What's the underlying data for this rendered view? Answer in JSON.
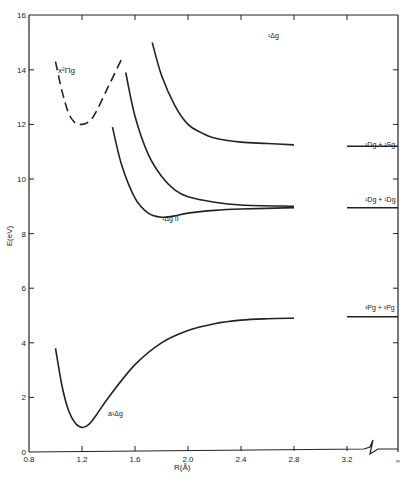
{
  "chart_data": {
    "type": "line",
    "title": "",
    "xlabel": "R(Å)",
    "ylabel": "E(eV)",
    "xlim": [
      0.8,
      3.2
    ],
    "ylim": [
      0,
      16
    ],
    "x_ticks": [
      "0.8",
      "1.2",
      "1.6",
      "2.0",
      "2.4",
      "2.8",
      "3.2",
      "∞"
    ],
    "y_ticks": [
      "0",
      "2",
      "4",
      "6",
      "8",
      "10",
      "12",
      "14",
      "16"
    ],
    "axis_break": "between 3.2 and ∞",
    "grid": false,
    "series": [
      {
        "name": "X²Πg",
        "style": "dashed",
        "x": [
          1.0,
          1.05,
          1.1,
          1.15,
          1.2,
          1.25,
          1.3,
          1.4,
          1.5
        ],
        "y": [
          14.3,
          13.2,
          12.4,
          12.05,
          12.0,
          12.1,
          12.4,
          13.4,
          14.4
        ]
      },
      {
        "name": "¹Δg (upper)",
        "style": "solid",
        "x": [
          1.73,
          1.8,
          1.9,
          2.0,
          2.1,
          2.2,
          2.4,
          2.6,
          2.8
        ],
        "y": [
          15.0,
          13.8,
          12.7,
          12.0,
          11.7,
          11.5,
          11.35,
          11.3,
          11.25
        ]
      },
      {
        "name": "¹Δg (middle)",
        "style": "solid",
        "x": [
          1.53,
          1.6,
          1.7,
          1.8,
          1.9,
          2.0,
          2.2,
          2.4,
          2.8
        ],
        "y": [
          13.9,
          12.3,
          10.9,
          10.1,
          9.6,
          9.35,
          9.15,
          9.05,
          9.0
        ]
      },
      {
        "name": "¹Δg II",
        "style": "solid",
        "x": [
          1.43,
          1.5,
          1.6,
          1.7,
          1.8,
          1.9,
          2.0,
          2.2,
          2.4,
          2.8
        ],
        "y": [
          11.9,
          10.5,
          9.3,
          8.75,
          8.6,
          8.65,
          8.75,
          8.85,
          8.9,
          8.95
        ]
      },
      {
        "name": "a¹Δg",
        "style": "solid",
        "x": [
          1.0,
          1.05,
          1.1,
          1.15,
          1.2,
          1.25,
          1.3,
          1.4,
          1.6,
          1.8,
          2.0,
          2.2,
          2.4,
          2.6,
          2.8
        ],
        "y": [
          3.8,
          2.4,
          1.5,
          1.05,
          0.9,
          1.0,
          1.3,
          2.0,
          3.2,
          4.0,
          4.45,
          4.7,
          4.83,
          4.88,
          4.9
        ]
      }
    ],
    "asymptotes": [
      {
        "label": "¹Dg + ¹Sg",
        "value": 11.2
      },
      {
        "label": "¹Dg + ¹Dg",
        "value": 8.95
      },
      {
        "label": "³Pg + ³Pg",
        "value": 4.95
      }
    ],
    "annotations": [
      {
        "text": "X²Πg",
        "x": 1.05,
        "y": 14.0
      },
      {
        "text": "¹Δg",
        "x": 2.55,
        "y": 15.2
      },
      {
        "text": "¹Δg II",
        "x": 1.78,
        "y": 8.25
      },
      {
        "text": "a¹Δg",
        "x": 1.38,
        "y": 1.7
      }
    ]
  },
  "labels": {
    "xlabel": "R(Å)",
    "ylabel": "E(eV)",
    "x_ticks": [
      "0.8",
      "1.2",
      "1.6",
      "2.0",
      "2.4",
      "2.8",
      "3.2",
      "∞"
    ],
    "y_ticks": [
      "0",
      "2",
      "4",
      "6",
      "8",
      "10",
      "12",
      "14",
      "16"
    ],
    "curve_X": "x²Πg",
    "curve_upper": "¹Δg",
    "curve_II": "¹Δg II",
    "curve_a": "a¹Δg",
    "asym_1": "¹Dg + ¹Sg",
    "asym_2": "¹Dg + ¹Dg",
    "asym_3": "³Pg + ³Pg"
  }
}
